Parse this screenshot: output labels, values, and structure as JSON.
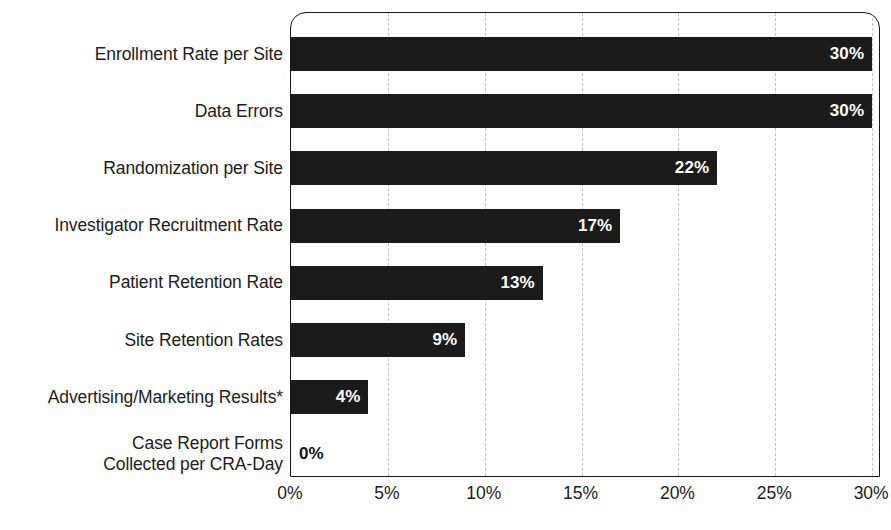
{
  "chart_data": {
    "type": "bar",
    "orientation": "horizontal",
    "title": "",
    "xlabel": "",
    "ylabel": "",
    "xlim": [
      0,
      30
    ],
    "grid": true,
    "legend": "none",
    "categories": [
      "Enrollment Rate per Site",
      "Data Errors",
      "Randomization per Site",
      "Investigator Recruitment Rate",
      "Patient Retention Rate",
      "Site Retention Rates",
      "Advertising/Marketing Results*",
      "Case Report Forms\nCollected per CRA-Day"
    ],
    "values": [
      30,
      30,
      22,
      17,
      13,
      9,
      4,
      0
    ],
    "value_labels": [
      "30%",
      "30%",
      "22%",
      "17%",
      "13%",
      "9%",
      "4%",
      "0%"
    ],
    "xticks": [
      0,
      5,
      10,
      15,
      20,
      25,
      30
    ],
    "xtick_labels": [
      "0%",
      "5%",
      "10%",
      "15%",
      "20%",
      "25%",
      "30%"
    ],
    "bar_color": "#1b1b1b",
    "label_color_inside": "#ffffff",
    "label_color_outside": "#111111",
    "gridline_color": "#c4c4c4",
    "axis_color": "#161616"
  }
}
